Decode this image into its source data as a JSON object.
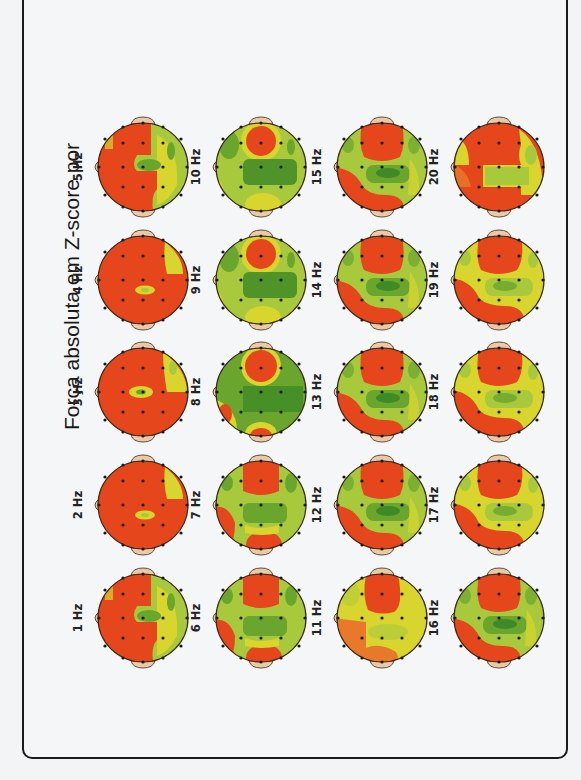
{
  "title": "Força absoluta em Z-score por",
  "colors": {
    "high": "#e6461c",
    "mid_high": "#e9792a",
    "mid": "#d8d52e",
    "low": "#a9c93d",
    "lower": "#6aa52e",
    "lowest": "#3f8a26",
    "outline": "#3a2a1a",
    "ear": "#e9c9a6",
    "electrode": "#1a1a1a"
  },
  "chart_data": {
    "type": "heatmap",
    "title": "Força absoluta em Z-score por",
    "subtype": "EEG topographic maps (scalp), 19 electrodes, 1–20 Hz",
    "orientation": "figure rotated 90° counter-clockwise; nose points left",
    "color_scale": [
      "dark green (low Z)",
      "green",
      "yellow-green",
      "yellow",
      "red-orange (high Z)"
    ],
    "maps": [
      {
        "label": "1 Hz",
        "freq": 1,
        "dominant": "red",
        "notes": "red frontal/left hemisphere; green central and right posterior"
      },
      {
        "label": "2 Hz",
        "freq": 2,
        "dominant": "red",
        "notes": "almost all red; small yellow central spot; yellow right-frontal patch"
      },
      {
        "label": "3 Hz",
        "freq": 3,
        "dominant": "red",
        "notes": "almost all red; yellow-green central spot and right patch"
      },
      {
        "label": "4 Hz",
        "freq": 4,
        "dominant": "red",
        "notes": "almost all red; small yellow central spot; yellow right patch"
      },
      {
        "label": "5 Hz",
        "freq": 5,
        "dominant": "red",
        "notes": "red frontal/occipital; green central band; yellow right"
      },
      {
        "label": "6 Hz",
        "freq": 6,
        "dominant": "mixed",
        "notes": "red frontal midline and occipital; green central"
      },
      {
        "label": "7 Hz",
        "freq": 7,
        "dominant": "mixed",
        "notes": "red frontal midline and occipital; green-yellow elsewhere"
      },
      {
        "label": "8 Hz",
        "freq": 8,
        "dominant": "green",
        "notes": "red frontal midline circle; green widespread; small red occipital"
      },
      {
        "label": "9 Hz",
        "freq": 9,
        "dominant": "green",
        "notes": "red frontal midline circle; green widespread; yellow occipital"
      },
      {
        "label": "10 Hz",
        "freq": 10,
        "dominant": "green",
        "notes": "red frontal midline circle; green widespread; yellow occipital"
      },
      {
        "label": "11 Hz",
        "freq": 11,
        "dominant": "yellow",
        "notes": "red frontal midline; yellow widespread; orange left temporal"
      },
      {
        "label": "12 Hz",
        "freq": 12,
        "dominant": "mixed",
        "notes": "red frontal; yellow-green central; red occipital"
      },
      {
        "label": "13 Hz",
        "freq": 13,
        "dominant": "mixed",
        "notes": "red frontal; green central; red occipital/left"
      },
      {
        "label": "14 Hz",
        "freq": 14,
        "dominant": "mixed",
        "notes": "red frontal; green central; red occipital/left"
      },
      {
        "label": "15 Hz",
        "freq": 15,
        "dominant": "mixed",
        "notes": "red frontal; green central; red occipital/left"
      },
      {
        "label": "16 Hz",
        "freq": 16,
        "dominant": "mixed",
        "notes": "red frontal; green central; red occipital/left"
      },
      {
        "label": "17 Hz",
        "freq": 17,
        "dominant": "mixed",
        "notes": "red frontal; yellow-green central; red occipital/left"
      },
      {
        "label": "18 Hz",
        "freq": 18,
        "dominant": "mixed",
        "notes": "red frontal; yellow-green central; red occipital/left"
      },
      {
        "label": "19 Hz",
        "freq": 19,
        "dominant": "mixed",
        "notes": "red frontal; yellow-green central; red occipital/left"
      },
      {
        "label": "20 Hz",
        "freq": 20,
        "dominant": "mixed",
        "notes": "red frontal; yellow central; red occipital/left"
      }
    ],
    "grid": {
      "rows": 5,
      "cols": 4,
      "reading_order": "bottom-to-top within columns, columns left-to-right"
    }
  },
  "maps": [
    {
      "label": "1 Hz",
      "col": 0,
      "row": 4,
      "type": "A"
    },
    {
      "label": "2 Hz",
      "col": 0,
      "row": 3,
      "type": "R"
    },
    {
      "label": "3 Hz",
      "col": 0,
      "row": 2,
      "type": "R2"
    },
    {
      "label": "4 Hz",
      "col": 0,
      "row": 1,
      "type": "R"
    },
    {
      "label": "5 Hz",
      "col": 0,
      "row": 0,
      "type": "A"
    },
    {
      "label": "6 Hz",
      "col": 1,
      "row": 4,
      "type": "M1"
    },
    {
      "label": "7 Hz",
      "col": 1,
      "row": 3,
      "type": "M1"
    },
    {
      "label": "8 Hz",
      "col": 1,
      "row": 2,
      "type": "G1"
    },
    {
      "label": "9 Hz",
      "col": 1,
      "row": 1,
      "type": "G"
    },
    {
      "label": "10 Hz",
      "col": 1,
      "row": 0,
      "type": "G"
    },
    {
      "label": "11 Hz",
      "col": 2,
      "row": 4,
      "type": "Y"
    },
    {
      "label": "12 Hz",
      "col": 2,
      "row": 3,
      "type": "B"
    },
    {
      "label": "13 Hz",
      "col": 2,
      "row": 2,
      "type": "B"
    },
    {
      "label": "14 Hz",
      "col": 2,
      "row": 1,
      "type": "B"
    },
    {
      "label": "15 Hz",
      "col": 2,
      "row": 0,
      "type": "B"
    },
    {
      "label": "16 Hz",
      "col": 3,
      "row": 4,
      "type": "B"
    },
    {
      "label": "17 Hz",
      "col": 3,
      "row": 3,
      "type": "C"
    },
    {
      "label": "18 Hz",
      "col": 3,
      "row": 2,
      "type": "C"
    },
    {
      "label": "19 Hz",
      "col": 3,
      "row": 1,
      "type": "C"
    },
    {
      "label": "20 Hz",
      "col": 3,
      "row": 0,
      "type": "D"
    }
  ]
}
